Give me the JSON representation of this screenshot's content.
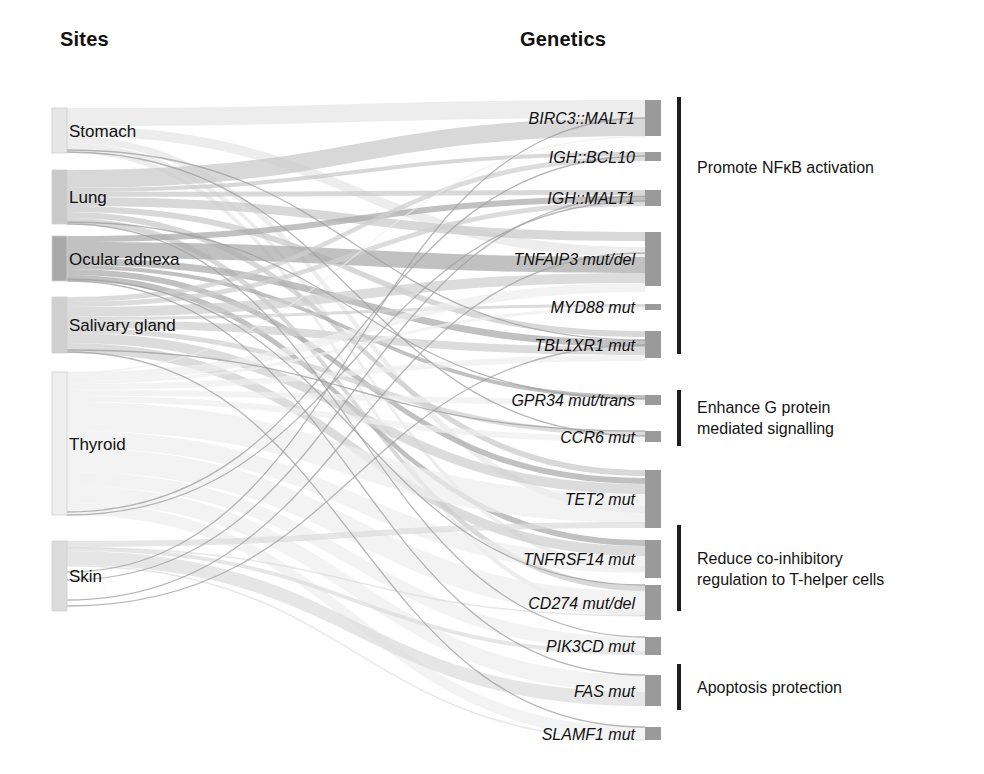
{
  "headers": {
    "left": "Sites",
    "right": "Genetics"
  },
  "colors": {
    "node_light": "#e2e2e2",
    "node_mid": "#c7c7c7",
    "node_dark": "#a8a8a8",
    "gene_node": "#9a9a9a",
    "bracket": "#1d1d1d",
    "text": "#111111",
    "link": "#b5b5b5"
  },
  "sites": [
    {
      "label": "Stomach",
      "y": 108,
      "h": 45,
      "shade": "#e6e6e6"
    },
    {
      "label": "Lung",
      "y": 170,
      "h": 54,
      "shade": "#c9c9c9"
    },
    {
      "label": "Ocular adnexa",
      "y": 236,
      "h": 45,
      "shade": "#a9a9a9"
    },
    {
      "label": "Salivary gland",
      "y": 297,
      "h": 56,
      "shade": "#cfcfcf"
    },
    {
      "label": "Thyroid",
      "y": 372,
      "h": 143,
      "shade": "#efefef"
    },
    {
      "label": "Skin",
      "y": 541,
      "h": 70,
      "shade": "#dcdcdc"
    }
  ],
  "genes": [
    {
      "label": "BIRC3::MALT1",
      "y": 100,
      "h": 36
    },
    {
      "label": "IGH::BCL10",
      "y": 152,
      "h": 9
    },
    {
      "label": "IGH::MALT1",
      "y": 190,
      "h": 16
    },
    {
      "label": "TNFAIP3 mut/del",
      "y": 232,
      "h": 54
    },
    {
      "label": "MYD88 mut",
      "y": 304,
      "h": 6
    },
    {
      "label": "TBL1XR1 mut",
      "y": 331,
      "h": 27
    },
    {
      "label": "GPR34 mut/trans",
      "y": 395,
      "h": 10
    },
    {
      "label": "CCR6 mut",
      "y": 431,
      "h": 11
    },
    {
      "label": "TET2 mut",
      "y": 470,
      "h": 58
    },
    {
      "label": "TNFRSF14 mut",
      "y": 540,
      "h": 38
    },
    {
      "label": "CD274 mut/del",
      "y": 585,
      "h": 35
    },
    {
      "label": "PIK3CD mut",
      "y": 637,
      "h": 18
    },
    {
      "label": "FAS mut",
      "y": 675,
      "h": 31
    },
    {
      "label": "SLAMF1 mut",
      "y": 727,
      "h": 13
    }
  ],
  "annotations": [
    {
      "text": "Promote NFκB activation",
      "bracket_y": 97,
      "bracket_h": 257,
      "text_y": 157
    },
    {
      "text": "Enhance G protein\nmediated signalling",
      "bracket_y": 390,
      "bracket_h": 56,
      "text_y": 397
    },
    {
      "text": "Reduce co-inhibitory\nregulation to T-helper cells",
      "bracket_y": 525,
      "bracket_h": 86,
      "text_y": 548
    },
    {
      "text": "Apoptosis protection",
      "bracket_y": 664,
      "bracket_h": 46,
      "text_y": 677
    }
  ],
  "chart_data": {
    "type": "sankey",
    "title": "",
    "left_axis_label": "Sites",
    "right_axis_label": "Genetics",
    "nodes_left": [
      "Stomach",
      "Lung",
      "Ocular adnexa",
      "Salivary gland",
      "Thyroid",
      "Skin"
    ],
    "nodes_right": [
      "BIRC3::MALT1",
      "IGH::BCL10",
      "IGH::MALT1",
      "TNFAIP3 mut/del",
      "MYD88 mut",
      "TBL1XR1 mut",
      "GPR34 mut/trans",
      "CCR6 mut",
      "TET2 mut",
      "TNFRSF14 mut",
      "CD274 mut/del",
      "PIK3CD mut",
      "FAS mut",
      "SLAMF1 mut"
    ],
    "node_totals_left": {
      "Stomach": 45,
      "Lung": 54,
      "Ocular adnexa": 45,
      "Salivary gland": 56,
      "Thyroid": 143,
      "Skin": 70
    },
    "node_totals_right": {
      "BIRC3::MALT1": 36,
      "IGH::BCL10": 9,
      "IGH::MALT1": 16,
      "TNFAIP3 mut/del": 54,
      "MYD88 mut": 6,
      "TBL1XR1 mut": 27,
      "GPR34 mut/trans": 10,
      "CCR6 mut": 11,
      "TET2 mut": 58,
      "TNFRSF14 mut": 38,
      "CD274 mut/del": 35,
      "PIK3CD mut": 18,
      "FAS mut": 31,
      "SLAMF1 mut": 13
    },
    "links": [
      {
        "source": "Stomach",
        "target": "BIRC3::MALT1",
        "value": 18,
        "sy": 108,
        "ty": 100
      },
      {
        "source": "Stomach",
        "target": "TNFAIP3 mut/del",
        "value": 10,
        "sy": 126,
        "ty": 247
      },
      {
        "source": "Stomach",
        "target": "TET2 mut",
        "value": 7,
        "sy": 136,
        "ty": 506
      },
      {
        "source": "Stomach",
        "target": "TNFRSF14 mut",
        "value": 5,
        "sy": 143,
        "ty": 566
      },
      {
        "source": "Stomach",
        "target": "CD274 mut/del",
        "value": 5,
        "sy": 148,
        "ty": 611
      },
      {
        "source": "Lung",
        "target": "BIRC3::MALT1",
        "value": 18,
        "sy": 170,
        "ty": 118
      },
      {
        "source": "Lung",
        "target": "IGH::BCL10",
        "value": 4,
        "sy": 188,
        "ty": 152
      },
      {
        "source": "Lung",
        "target": "IGH::MALT1",
        "value": 5,
        "sy": 192,
        "ty": 190
      },
      {
        "source": "Lung",
        "target": "TNFAIP3 mut/del",
        "value": 9,
        "sy": 197,
        "ty": 232
      },
      {
        "source": "Lung",
        "target": "TBL1XR1 mut",
        "value": 6,
        "sy": 206,
        "ty": 331
      },
      {
        "source": "Lung",
        "target": "TET2 mut",
        "value": 6,
        "sy": 212,
        "ty": 470
      },
      {
        "source": "Lung",
        "target": "CD274 mut/del",
        "value": 6,
        "sy": 218,
        "ty": 585
      },
      {
        "source": "Ocular adnexa",
        "target": "IGH::MALT1",
        "value": 6,
        "sy": 236,
        "ty": 196
      },
      {
        "source": "Ocular adnexa",
        "target": "TNFAIP3 mut/del",
        "value": 16,
        "sy": 242,
        "ty": 257
      },
      {
        "source": "Ocular adnexa",
        "target": "TBL1XR1 mut",
        "value": 7,
        "sy": 258,
        "ty": 340
      },
      {
        "source": "Ocular adnexa",
        "target": "GPR34 mut/trans",
        "value": 4,
        "sy": 265,
        "ty": 395
      },
      {
        "source": "Ocular adnexa",
        "target": "TET2 mut",
        "value": 6,
        "sy": 269,
        "ty": 478
      },
      {
        "source": "Ocular adnexa",
        "target": "TNFRSF14 mut",
        "value": 6,
        "sy": 275,
        "ty": 540
      },
      {
        "source": "Salivary gland",
        "target": "IGH::BCL10",
        "value": 5,
        "sy": 297,
        "ty": 156
      },
      {
        "source": "Salivary gland",
        "target": "IGH::MALT1",
        "value": 5,
        "sy": 302,
        "ty": 201
      },
      {
        "source": "Salivary gland",
        "target": "TNFAIP3 mut/del",
        "value": 10,
        "sy": 307,
        "ty": 273
      },
      {
        "source": "Salivary gland",
        "target": "MYD88 mut",
        "value": 3,
        "sy": 317,
        "ty": 304
      },
      {
        "source": "Salivary gland",
        "target": "TBL1XR1 mut",
        "value": 8,
        "sy": 320,
        "ty": 347
      },
      {
        "source": "Salivary gland",
        "target": "CCR6 mut",
        "value": 5,
        "sy": 328,
        "ty": 431
      },
      {
        "source": "Salivary gland",
        "target": "TET2 mut",
        "value": 10,
        "sy": 333,
        "ty": 484
      },
      {
        "source": "Salivary gland",
        "target": "TNFRSF14 mut",
        "value": 10,
        "sy": 343,
        "ty": 546
      },
      {
        "source": "Thyroid",
        "target": "BIRC3::MALT1",
        "value": 0,
        "sy": 372,
        "ty": 136
      },
      {
        "source": "Thyroid",
        "target": "TNFAIP3 mut/del",
        "value": 9,
        "sy": 372,
        "ty": 283
      },
      {
        "source": "Thyroid",
        "target": "MYD88 mut",
        "value": 3,
        "sy": 381,
        "ty": 307
      },
      {
        "source": "Thyroid",
        "target": "TBL1XR1 mut",
        "value": 6,
        "sy": 384,
        "ty": 355
      },
      {
        "source": "Thyroid",
        "target": "GPR34 mut/trans",
        "value": 6,
        "sy": 390,
        "ty": 399
      },
      {
        "source": "Thyroid",
        "target": "CCR6 mut",
        "value": 6,
        "sy": 396,
        "ty": 436
      },
      {
        "source": "Thyroid",
        "target": "TET2 mut",
        "value": 29,
        "sy": 402,
        "ty": 494
      },
      {
        "source": "Thyroid",
        "target": "TNFRSF14 mut",
        "value": 17,
        "sy": 431,
        "ty": 556
      },
      {
        "source": "Thyroid",
        "target": "CD274 mut/del",
        "value": 24,
        "sy": 448,
        "ty": 591
      },
      {
        "source": "Thyroid",
        "target": "PIK3CD mut",
        "value": 14,
        "sy": 472,
        "ty": 637
      },
      {
        "source": "Thyroid",
        "target": "FAS mut",
        "value": 17,
        "sy": 486,
        "ty": 675
      },
      {
        "source": "Thyroid",
        "target": "SLAMF1 mut",
        "value": 12,
        "sy": 503,
        "ty": 727
      },
      {
        "source": "Skin",
        "target": "TET2 mut",
        "value": 6,
        "sy": 541,
        "ty": 522
      },
      {
        "source": "Skin",
        "target": "CD274 mut/del",
        "value": 0,
        "sy": 547,
        "ty": 615
      },
      {
        "source": "Skin",
        "target": "PIK3CD mut",
        "value": 4,
        "sy": 547,
        "ty": 651
      },
      {
        "source": "Skin",
        "target": "FAS mut",
        "value": 14,
        "sy": 551,
        "ty": 692
      },
      {
        "source": "Skin",
        "target": "SLAMF1 mut",
        "value": 1,
        "sy": 565,
        "ty": 739
      }
    ],
    "thin_links": [
      {
        "sy": 150,
        "ty": 340
      },
      {
        "sy": 152,
        "ty": 436
      },
      {
        "sy": 222,
        "ty": 399
      },
      {
        "sy": 224,
        "ty": 637
      },
      {
        "sy": 279,
        "ty": 585
      },
      {
        "sy": 281,
        "ty": 675
      },
      {
        "sy": 350,
        "ty": 431
      },
      {
        "sy": 352,
        "ty": 727
      },
      {
        "sy": 512,
        "ty": 156
      },
      {
        "sy": 515,
        "ty": 201
      },
      {
        "sy": 572,
        "ty": 118
      },
      {
        "sy": 580,
        "ty": 196
      },
      {
        "sy": 600,
        "ty": 253
      },
      {
        "sy": 606,
        "ty": 345
      }
    ]
  }
}
